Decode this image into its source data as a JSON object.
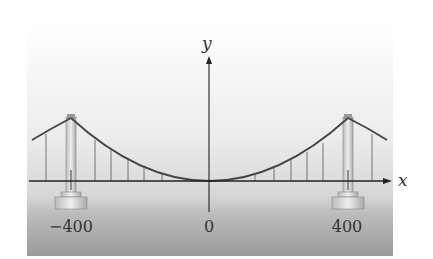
{
  "diagram": {
    "axes": {
      "x_label": "x",
      "y_label": "y"
    },
    "tick_labels": {
      "left": "−400",
      "origin": "0",
      "right": "400"
    },
    "elements": [
      "sky-gradient-background",
      "water-gradient",
      "left-tower",
      "right-tower",
      "parabolic-main-cable",
      "side-span-cables",
      "vertical-suspenders",
      "x-axis-arrow",
      "y-axis-arrow"
    ],
    "colors": {
      "line": "#333333",
      "tower": "#cfcfcf",
      "water": "#9a9a9a"
    }
  }
}
